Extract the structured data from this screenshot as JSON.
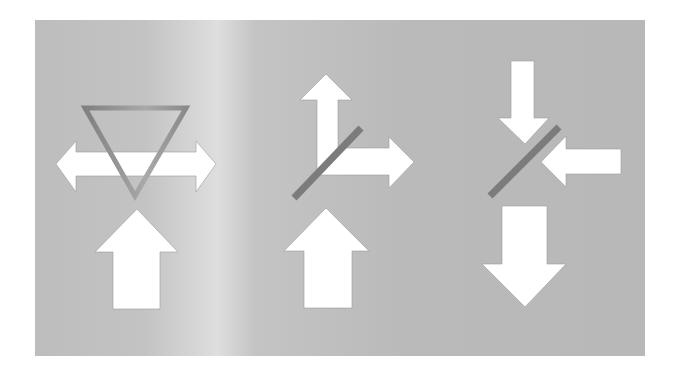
{
  "diagram": {
    "title": "Beam splitting and combining",
    "colors": {
      "page_background": "#ffffff",
      "panel_base": "#b9b9b9",
      "panel_highlight": "#dcdcdc",
      "arrow_fill": "#ffffff",
      "arrow_edge": "#9a9a9a",
      "mirror": "#7c7c7c",
      "prism_outline_dark": "#858585",
      "prism_outline_light": "#a8a8a8"
    },
    "panels": [
      {
        "name": "prism-dispersion",
        "element": "triangular prism",
        "input_arrows": [
          "up"
        ],
        "output_arrows": [
          "left",
          "right"
        ]
      },
      {
        "name": "beam-splitter",
        "element": "diagonal partial mirror",
        "input_arrows": [
          "up"
        ],
        "output_arrows": [
          "up",
          "right"
        ]
      },
      {
        "name": "beam-combiner",
        "element": "diagonal partial mirror",
        "input_arrows": [
          "down",
          "left"
        ],
        "output_arrows": [
          "down"
        ]
      }
    ]
  }
}
